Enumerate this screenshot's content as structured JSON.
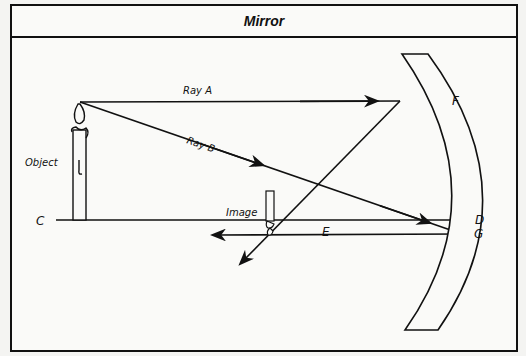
{
  "title": "Mirror",
  "labels": {
    "ray_a": "Ray A",
    "ray_b": "Ray B",
    "object": "Object",
    "image": "Image",
    "c": "C",
    "d": "D",
    "e": "E",
    "f": "F",
    "g": "G"
  },
  "colors": {
    "line": "#111111",
    "background": "#fafaf8"
  }
}
